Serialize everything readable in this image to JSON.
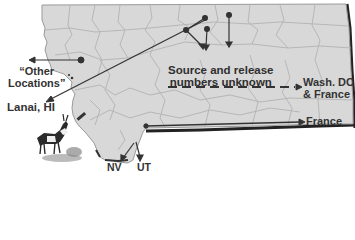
{
  "map": {
    "region": "Montana",
    "fill_color": "#d8d8d8",
    "county_line_color": "#b5b5b5",
    "border_color": "#2a2a2a",
    "arrow_color": "#333333"
  },
  "labels": {
    "other_locations_line1": "“Other",
    "other_locations_line2": "Locations”",
    "lanai": "Lanai, HI",
    "source_line1": "Source and release",
    "source_line2": "numbers unknown",
    "wash_line1": "Wash. DC",
    "wash_line2": "& France",
    "france": "France",
    "nv": "NV",
    "ut": "UT"
  },
  "icons": {
    "pronghorn": "pronghorn-antelope-illustration"
  }
}
